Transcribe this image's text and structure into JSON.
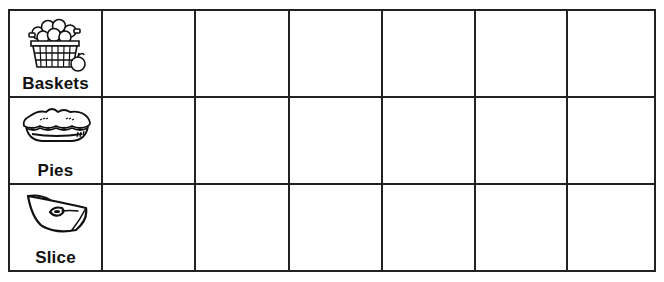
{
  "worksheet": {
    "rows": [
      {
        "label": "Baskets",
        "icon": "apple-basket-icon",
        "cells": [
          "",
          "",
          "",
          "",
          "",
          ""
        ]
      },
      {
        "label": "Pies",
        "icon": "apple-pie-icon",
        "cells": [
          "",
          "",
          "",
          "",
          "",
          ""
        ]
      },
      {
        "label": "Slice",
        "icon": "apple-slice-icon",
        "cells": [
          "",
          "",
          "",
          "",
          "",
          ""
        ]
      }
    ],
    "colors": {
      "line": "#222222",
      "background": "#ffffff",
      "text": "#111111"
    }
  }
}
